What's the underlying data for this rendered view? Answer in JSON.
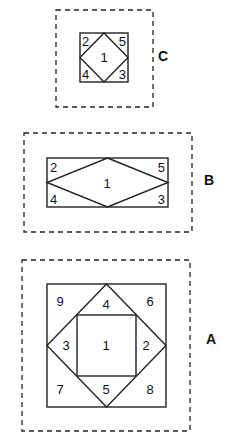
{
  "diagrams": [
    {
      "id": "C",
      "label": "C",
      "description": "Square block with inscribed diamond",
      "regions": [
        "1",
        "2",
        "3",
        "4",
        "5"
      ]
    },
    {
      "id": "B",
      "label": "B",
      "description": "Rectangular block with inscribed elongated diamond",
      "regions": [
        "1",
        "2",
        "3",
        "4",
        "5"
      ]
    },
    {
      "id": "A",
      "label": "A",
      "description": "Square-in-diamond-in-square block",
      "regions": [
        "1",
        "2",
        "3",
        "4",
        "5",
        "6",
        "7",
        "8",
        "9"
      ]
    }
  ],
  "C": {
    "label": "C",
    "n1": "1",
    "n2": "2",
    "n3": "3",
    "n4": "4",
    "n5": "5"
  },
  "B": {
    "label": "B",
    "n1": "1",
    "n2": "2",
    "n3": "3",
    "n4": "4",
    "n5": "5"
  },
  "A": {
    "label": "A",
    "n1": "1",
    "n2": "2",
    "n3": "3",
    "n4": "4",
    "n5": "5",
    "n6": "6",
    "n7": "7",
    "n8": "8",
    "n9": "9"
  }
}
